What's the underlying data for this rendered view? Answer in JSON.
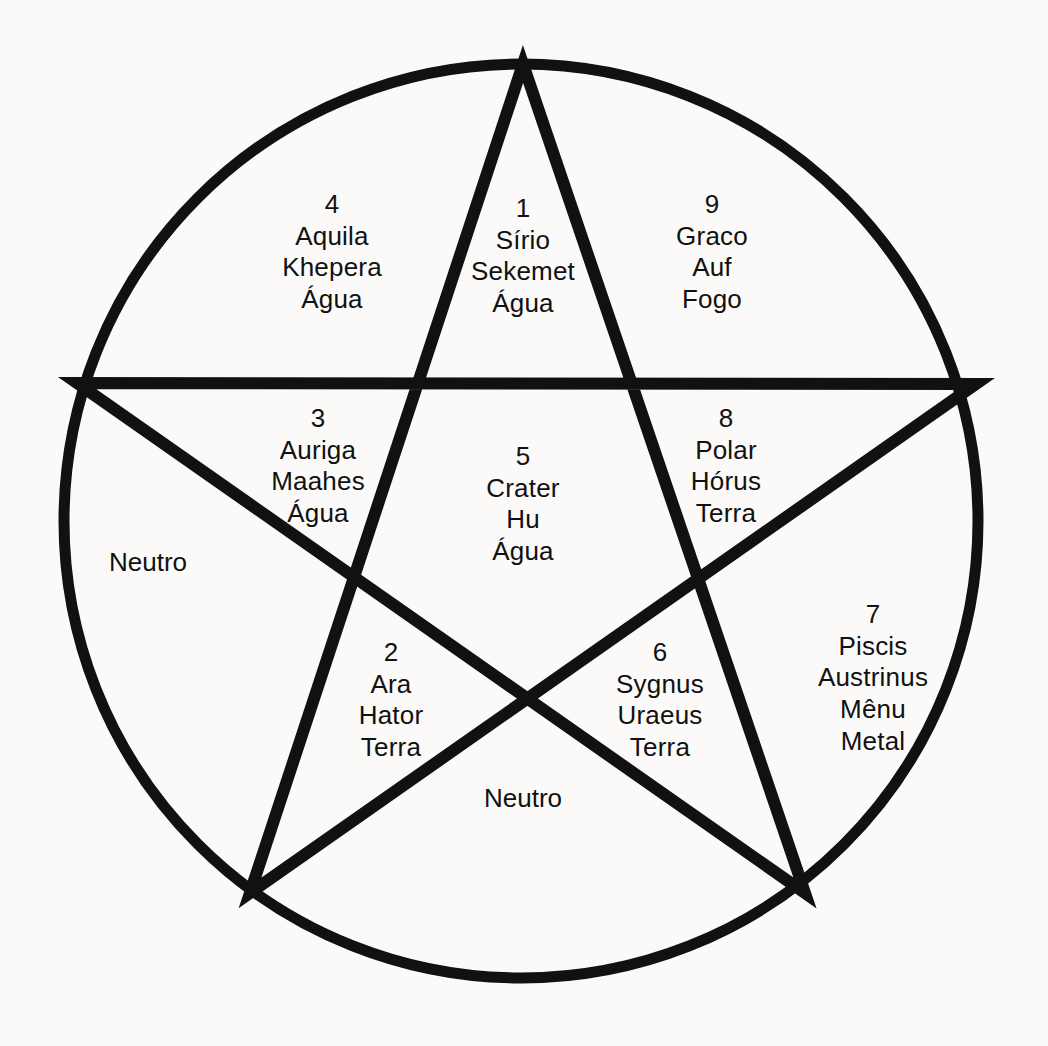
{
  "diagram": {
    "type": "pentagram-inscribed-in-circle",
    "stroke_color": "#111111",
    "background_color": "#fbfaf8",
    "circle": {
      "cx": 521,
      "cy": 521,
      "r": 457,
      "stroke_width": 11
    },
    "star": {
      "stroke_width": 12,
      "vertices": [
        {
          "name": "top",
          "x": 523,
          "y": 64
        },
        {
          "name": "right",
          "x": 976,
          "y": 384
        },
        {
          "name": "bottom-right",
          "x": 805,
          "y": 893
        },
        {
          "name": "bottom-left",
          "x": 250,
          "y": 893
        },
        {
          "name": "left",
          "x": 77,
          "y": 383
        }
      ]
    }
  },
  "regions": [
    {
      "id": "region-1",
      "number": "1",
      "constellation": "Sírio",
      "deity": "Sekemet",
      "element": "Água",
      "x": 523,
      "y": 256
    },
    {
      "id": "region-4",
      "number": "4",
      "constellation": "Aquila",
      "deity": "Khepera",
      "element": "Água",
      "x": 332,
      "y": 252
    },
    {
      "id": "region-9",
      "number": "9",
      "constellation": "Graco",
      "deity": "Auf",
      "element": "Fogo",
      "x": 712,
      "y": 252
    },
    {
      "id": "region-3",
      "number": "3",
      "constellation": "Auriga",
      "deity": "Maahes",
      "element": "Água",
      "x": 318,
      "y": 466
    },
    {
      "id": "region-8",
      "number": "8",
      "constellation": "Polar",
      "deity": "Hórus",
      "element": "Terra",
      "x": 726,
      "y": 466
    },
    {
      "id": "region-5",
      "number": "5",
      "constellation": "Crater",
      "deity": "Hu",
      "element": "Água",
      "x": 523,
      "y": 504
    },
    {
      "id": "region-2",
      "number": "2",
      "constellation": "Ara",
      "deity": "Hator",
      "element": "Terra",
      "x": 391,
      "y": 700
    },
    {
      "id": "region-6",
      "number": "6",
      "constellation": "Sygnus",
      "deity": "Uraeus",
      "element": "Terra",
      "x": 660,
      "y": 700
    }
  ],
  "region_seven": {
    "id": "region-7",
    "number": "7",
    "constellation_line1": "Piscis",
    "constellation_line2": "Austrinus",
    "deity": "Mênu",
    "element": "Metal",
    "x": 873,
    "y": 678
  },
  "neutral_regions": [
    {
      "id": "neutral-left",
      "label": "Neutro",
      "x": 148,
      "y": 562
    },
    {
      "id": "neutral-bottom",
      "label": "Neutro",
      "x": 523,
      "y": 798
    }
  ]
}
